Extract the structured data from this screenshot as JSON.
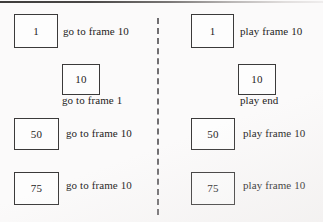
{
  "figure": {
    "background_color": "#fbfafa",
    "divider": {
      "style": "dashed-vertical",
      "color": "#58565a"
    }
  },
  "columns": [
    {
      "name": "go-to-column",
      "cells": [
        {
          "frame": "1",
          "action": "go to frame 10",
          "label_position": "right"
        },
        {
          "frame": "10",
          "action": "go to frame 1",
          "label_position": "below"
        },
        {
          "frame": "50",
          "action": "go to frame 10",
          "label_position": "right"
        },
        {
          "frame": "75",
          "action": "go to frame 10",
          "label_position": "right"
        }
      ]
    },
    {
      "name": "play-column",
      "cells": [
        {
          "frame": "1",
          "action": "play frame 10",
          "label_position": "right"
        },
        {
          "frame": "10",
          "action": "play end",
          "label_position": "below"
        },
        {
          "frame": "50",
          "action": "play frame 10",
          "label_position": "right"
        },
        {
          "frame": "75",
          "action": "play frame 10",
          "label_position": "right"
        }
      ]
    }
  ]
}
